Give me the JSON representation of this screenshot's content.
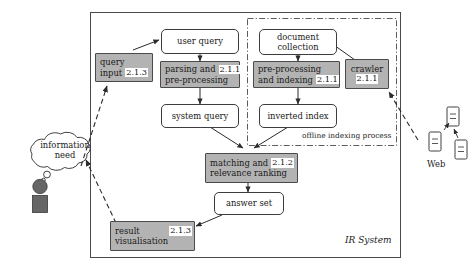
{
  "diagram": {
    "system_label": "IR System",
    "offline_label": "offline indexing process",
    "web_label": "Web",
    "actor": {
      "thought_line1": "information",
      "thought_line2": "need",
      "person_icon": "person-icon",
      "cloud_icon": "thought-cloud-icon"
    },
    "colors": {
      "grey_fill": "#b3b3b3",
      "white_fill": "#ffffff",
      "stroke": "#3d3d3d",
      "person_fill": "#666666"
    },
    "nodes": [
      {
        "id": "query-input",
        "line1": "query",
        "line2": "input",
        "section": "2.1.3",
        "style": "grey",
        "badge_pos": "inline-right"
      },
      {
        "id": "user-query",
        "line1": "user query",
        "line2": "",
        "section": "",
        "style": "round",
        "badge_pos": "none"
      },
      {
        "id": "parsing",
        "line1": "parsing and",
        "line2": "pre-processing",
        "section": "2.1.1",
        "style": "grey",
        "badge_pos": "top-right"
      },
      {
        "id": "system-query",
        "line1": "system query",
        "line2": "",
        "section": "",
        "style": "round",
        "badge_pos": "none"
      },
      {
        "id": "document-collection",
        "line1": "document",
        "line2": "collection",
        "section": "",
        "style": "round",
        "badge_pos": "none"
      },
      {
        "id": "preprocessing-indexing",
        "line1": "pre-processing",
        "line2": "and indexing",
        "section": "2.1.1",
        "style": "grey",
        "badge_pos": "bottom-right"
      },
      {
        "id": "inverted-index",
        "line1": "inverted index",
        "line2": "",
        "section": "",
        "style": "round",
        "badge_pos": "none"
      },
      {
        "id": "crawler",
        "line1": "crawler",
        "line2": "2.1.1",
        "section": "2.1.1",
        "style": "grey",
        "badge_pos": "stacked"
      },
      {
        "id": "matching-ranking",
        "line1": "matching and",
        "line2": "relevance ranking",
        "section": "2.1.2",
        "style": "grey",
        "badge_pos": "top-right"
      },
      {
        "id": "answer-set",
        "line1": "answer set",
        "line2": "",
        "section": "",
        "style": "round",
        "badge_pos": "none"
      },
      {
        "id": "result-visualisation",
        "line1": "result",
        "line2": "visualisation",
        "section": "2.1.3",
        "style": "grey",
        "badge_pos": "top-right"
      }
    ]
  }
}
